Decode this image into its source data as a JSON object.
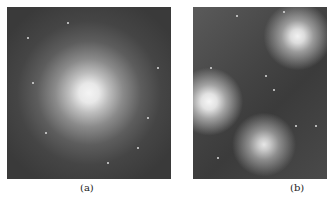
{
  "figure": {
    "panels": [
      {
        "id": "a",
        "caption": "(a)",
        "description": "globular star cluster, dense bright core on dark starfield"
      },
      {
        "id": "b",
        "caption": "(b)",
        "description": "bright stars with reflection nebulosity (Pleiades-like)"
      }
    ]
  }
}
